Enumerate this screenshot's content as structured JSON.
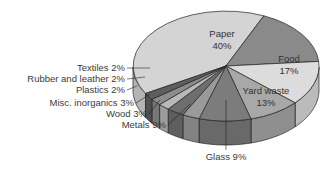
{
  "chart_data": {
    "type": "pie",
    "style": "3d-exploded-perspective",
    "title": "",
    "categories": [
      "Paper",
      "Food",
      "Yard waste",
      "Glass",
      "Metals",
      "Wood",
      "Misc. inorganics",
      "Plastics",
      "Rubber and leather",
      "Textiles"
    ],
    "values": [
      40,
      17,
      13,
      9,
      9,
      3,
      3,
      2,
      2,
      2
    ],
    "unit": "%",
    "colors": {
      "Paper": "#d4d4d4",
      "Food": "#8a8a8a",
      "Yard waste": "#dcdcdc",
      "Glass": "#a8a8a8",
      "Metals": "#7c7c7c",
      "Wood": "#9a9a9a",
      "Misc. inorganics": "#6e6e6e",
      "Plastics": "#b8b8b8",
      "Rubber and leather": "#8c8c8c",
      "Textiles": "#5e5e5e"
    },
    "labels": {
      "paper": {
        "name": "Paper",
        "pct": "40%"
      },
      "food": {
        "name": "Food",
        "pct": "17%"
      },
      "yard": {
        "name": "Yard waste",
        "pct": "13%"
      },
      "glass": "Glass  9%",
      "metals": "Metals  9%",
      "wood": "Wood  3%",
      "misc": "Misc. inorganics  3%",
      "plastics": "Plastics  2%",
      "rubber": "Rubber and leather  2%",
      "textiles": "Textiles  2%"
    },
    "legend": "none (callout labels)"
  }
}
